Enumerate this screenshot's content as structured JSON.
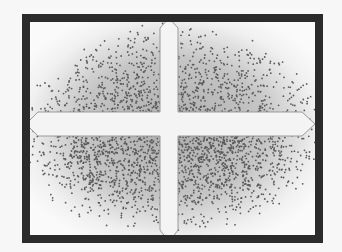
{
  "figure": {
    "colors": {
      "frame": "#2b2b2b",
      "background": "#fafafa",
      "dots": "#5a5a5a",
      "cross_fill": "#f4f4f4",
      "cross_stroke": "#9a9a9a"
    }
  }
}
